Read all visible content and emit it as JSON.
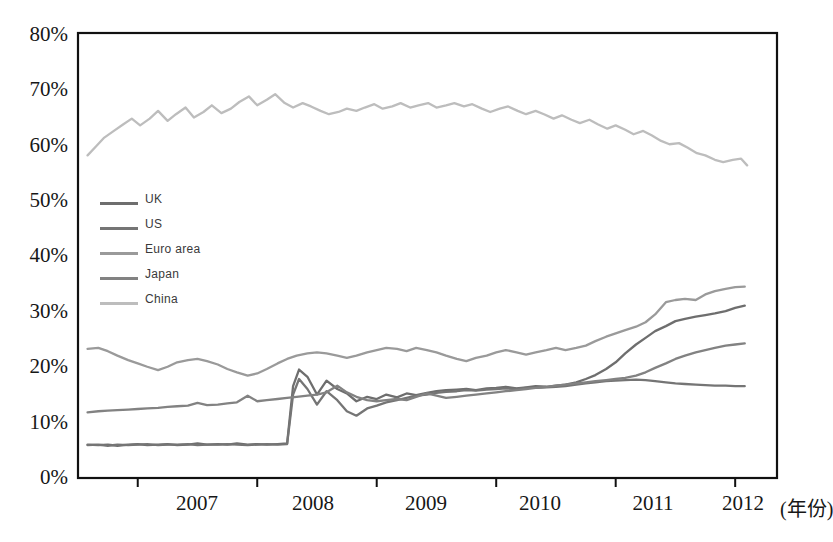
{
  "chart_data": {
    "type": "line",
    "title": "",
    "subtitle": "",
    "xlabel": "(年份)",
    "ylabel": "",
    "xlim": [
      2006.5,
      2012.35
    ],
    "ylim": [
      0,
      80
    ],
    "grid": false,
    "legend_position": "inside-left-upper-middle",
    "ytick_labels": [
      "80%",
      "70%",
      "60%",
      "50%",
      "40%",
      "30%",
      "20%",
      "10%",
      "0%"
    ],
    "ytick_values": [
      80,
      70,
      60,
      50,
      40,
      30,
      20,
      10,
      0
    ],
    "xtick_labels": [
      "2007",
      "2008",
      "2009",
      "2010",
      "2011",
      "2012"
    ],
    "xtick_values": [
      2007,
      2008,
      2009,
      2010,
      2011,
      2012
    ],
    "axis_unit_note": "(年份)",
    "series": [
      {
        "name": "UK",
        "color": "#6e6e6e",
        "x": [
          2006.58,
          2006.67,
          2006.75,
          2006.83,
          2006.92,
          2007.0,
          2007.08,
          2007.17,
          2007.25,
          2007.33,
          2007.42,
          2007.5,
          2007.58,
          2007.67,
          2007.75,
          2007.83,
          2007.92,
          2008.0,
          2008.08,
          2008.17,
          2008.25,
          2008.3,
          2008.35,
          2008.42,
          2008.5,
          2008.58,
          2008.67,
          2008.75,
          2008.83,
          2008.92,
          2009.0,
          2009.08,
          2009.17,
          2009.25,
          2009.33,
          2009.42,
          2009.5,
          2009.58,
          2009.67,
          2009.75,
          2009.83,
          2009.92,
          2010.0,
          2010.08,
          2010.17,
          2010.25,
          2010.33,
          2010.42,
          2010.5,
          2010.58,
          2010.67,
          2010.75,
          2010.83,
          2010.92,
          2011.0,
          2011.08,
          2011.17,
          2011.25,
          2011.33,
          2011.42,
          2011.5,
          2011.58,
          2011.67,
          2011.75,
          2011.83,
          2011.92,
          2012.0,
          2012.08
        ],
        "values": [
          6.0,
          5.9,
          6.0,
          5.8,
          6.0,
          6.1,
          5.9,
          6.0,
          6.1,
          5.9,
          6.0,
          6.2,
          6.0,
          6.1,
          6.0,
          6.2,
          6.0,
          6.1,
          6.0,
          6.1,
          6.2,
          16.5,
          19.5,
          18.2,
          15.0,
          17.5,
          16.0,
          15.2,
          13.8,
          14.6,
          14.2,
          15.0,
          14.5,
          15.2,
          14.9,
          15.3,
          15.6,
          15.8,
          15.9,
          16.0,
          15.8,
          16.1,
          16.2,
          16.4,
          16.1,
          16.3,
          16.5,
          16.4,
          16.6,
          16.8,
          17.2,
          17.8,
          18.5,
          19.6,
          20.8,
          22.4,
          24.0,
          25.2,
          26.4,
          27.3,
          28.2,
          28.6,
          29.0,
          29.3,
          29.6,
          30.0,
          30.6,
          31.0
        ]
      },
      {
        "name": "US",
        "color": "#757575",
        "x": [
          2006.58,
          2006.67,
          2006.75,
          2006.83,
          2006.92,
          2007.0,
          2007.08,
          2007.17,
          2007.25,
          2007.33,
          2007.42,
          2007.5,
          2007.58,
          2007.67,
          2007.75,
          2007.83,
          2007.92,
          2008.0,
          2008.08,
          2008.17,
          2008.25,
          2008.3,
          2008.35,
          2008.42,
          2008.5,
          2008.58,
          2008.67,
          2008.75,
          2008.83,
          2008.92,
          2009.0,
          2009.08,
          2009.17,
          2009.25,
          2009.33,
          2009.42,
          2009.5,
          2009.58,
          2009.67,
          2009.75,
          2009.83,
          2009.92,
          2010.0,
          2010.08,
          2010.17,
          2010.25,
          2010.33,
          2010.42,
          2010.5,
          2010.58,
          2010.67,
          2010.75,
          2010.83,
          2010.92,
          2011.0,
          2011.08,
          2011.17,
          2011.25,
          2011.33,
          2011.42,
          2011.5,
          2011.58,
          2011.67,
          2011.75,
          2011.83,
          2011.92,
          2012.0,
          2012.08
        ],
        "values": [
          5.9,
          6.0,
          5.8,
          6.0,
          5.9,
          6.0,
          6.1,
          5.9,
          6.0,
          6.0,
          6.1,
          5.9,
          6.0,
          6.0,
          6.1,
          6.0,
          5.9,
          6.0,
          6.1,
          6.0,
          6.1,
          15.0,
          17.8,
          16.0,
          13.2,
          15.6,
          14.0,
          12.0,
          11.2,
          12.5,
          13.0,
          13.6,
          14.0,
          14.4,
          14.8,
          15.0,
          15.3,
          15.5,
          15.6,
          15.8,
          15.7,
          15.9,
          16.0,
          16.1,
          16.0,
          16.2,
          16.2,
          16.3,
          16.4,
          16.5,
          16.8,
          17.0,
          17.2,
          17.4,
          17.5,
          17.6,
          17.7,
          17.6,
          17.4,
          17.2,
          17.0,
          16.9,
          16.8,
          16.7,
          16.6,
          16.6,
          16.5,
          16.5
        ]
      },
      {
        "name": "Euro area",
        "color": "#9a9a9a",
        "x": [
          2006.58,
          2006.67,
          2006.75,
          2006.83,
          2006.92,
          2007.0,
          2007.08,
          2007.17,
          2007.25,
          2007.33,
          2007.42,
          2007.5,
          2007.58,
          2007.67,
          2007.75,
          2007.83,
          2007.92,
          2008.0,
          2008.08,
          2008.17,
          2008.25,
          2008.33,
          2008.42,
          2008.5,
          2008.58,
          2008.67,
          2008.75,
          2008.83,
          2008.92,
          2009.0,
          2009.08,
          2009.17,
          2009.25,
          2009.33,
          2009.42,
          2009.5,
          2009.58,
          2009.67,
          2009.75,
          2009.83,
          2009.92,
          2010.0,
          2010.08,
          2010.17,
          2010.25,
          2010.33,
          2010.42,
          2010.5,
          2010.58,
          2010.67,
          2010.75,
          2010.83,
          2010.92,
          2011.0,
          2011.08,
          2011.17,
          2011.25,
          2011.33,
          2011.42,
          2011.5,
          2011.58,
          2011.67,
          2011.75,
          2011.83,
          2011.92,
          2012.0,
          2012.08
        ],
        "values": [
          23.2,
          23.4,
          22.8,
          22.0,
          21.2,
          20.6,
          20.0,
          19.4,
          20.0,
          20.8,
          21.2,
          21.4,
          21.0,
          20.4,
          19.6,
          19.0,
          18.4,
          18.8,
          19.6,
          20.6,
          21.4,
          22.0,
          22.4,
          22.6,
          22.4,
          22.0,
          21.6,
          22.0,
          22.6,
          23.0,
          23.4,
          23.2,
          22.8,
          23.4,
          23.0,
          22.6,
          22.0,
          21.4,
          21.0,
          21.6,
          22.0,
          22.6,
          23.0,
          22.6,
          22.2,
          22.6,
          23.0,
          23.4,
          23.0,
          23.4,
          23.8,
          24.6,
          25.4,
          26.0,
          26.6,
          27.2,
          28.0,
          29.4,
          31.6,
          32.0,
          32.2,
          32.0,
          33.0,
          33.6,
          34.0,
          34.3,
          34.4
        ]
      },
      {
        "name": "Japan",
        "color": "#828282",
        "x": [
          2006.58,
          2006.67,
          2006.75,
          2006.83,
          2006.92,
          2007.0,
          2007.08,
          2007.17,
          2007.25,
          2007.33,
          2007.42,
          2007.5,
          2007.58,
          2007.67,
          2007.75,
          2007.83,
          2007.92,
          2008.0,
          2008.08,
          2008.17,
          2008.25,
          2008.33,
          2008.42,
          2008.5,
          2008.58,
          2008.67,
          2008.75,
          2008.83,
          2008.92,
          2009.0,
          2009.08,
          2009.17,
          2009.25,
          2009.33,
          2009.42,
          2009.5,
          2009.58,
          2009.67,
          2009.75,
          2009.83,
          2009.92,
          2010.0,
          2010.08,
          2010.17,
          2010.25,
          2010.33,
          2010.42,
          2010.5,
          2010.58,
          2010.67,
          2010.75,
          2010.83,
          2010.92,
          2011.0,
          2011.08,
          2011.17,
          2011.25,
          2011.33,
          2011.42,
          2011.5,
          2011.58,
          2011.67,
          2011.75,
          2011.83,
          2011.92,
          2012.0,
          2012.08
        ],
        "values": [
          11.8,
          12.0,
          12.1,
          12.2,
          12.3,
          12.4,
          12.5,
          12.6,
          12.8,
          12.9,
          13.0,
          13.5,
          13.1,
          13.2,
          13.4,
          13.6,
          14.8,
          13.8,
          14.0,
          14.2,
          14.4,
          14.6,
          14.8,
          15.0,
          15.4,
          16.6,
          15.4,
          14.6,
          14.0,
          13.8,
          14.0,
          14.2,
          14.0,
          14.6,
          15.2,
          14.8,
          14.4,
          14.6,
          14.8,
          15.0,
          15.2,
          15.4,
          15.6,
          15.8,
          16.0,
          16.2,
          16.4,
          16.6,
          16.8,
          17.0,
          17.2,
          17.4,
          17.6,
          17.8,
          18.0,
          18.4,
          19.0,
          19.8,
          20.6,
          21.4,
          22.0,
          22.6,
          23.0,
          23.4,
          23.8,
          24.0,
          24.2
        ]
      },
      {
        "name": "China",
        "color": "#bdbdbd",
        "x": [
          2006.58,
          2006.65,
          2006.72,
          2006.8,
          2006.88,
          2006.95,
          2007.02,
          2007.1,
          2007.17,
          2007.25,
          2007.32,
          2007.4,
          2007.47,
          2007.55,
          2007.62,
          2007.7,
          2007.78,
          2007.85,
          2007.93,
          2008.0,
          2008.08,
          2008.15,
          2008.23,
          2008.3,
          2008.38,
          2008.45,
          2008.53,
          2008.6,
          2008.68,
          2008.75,
          2008.83,
          2008.9,
          2008.98,
          2009.05,
          2009.13,
          2009.2,
          2009.28,
          2009.35,
          2009.43,
          2009.5,
          2009.58,
          2009.65,
          2009.73,
          2009.8,
          2009.88,
          2009.95,
          2010.03,
          2010.1,
          2010.18,
          2010.25,
          2010.33,
          2010.4,
          2010.48,
          2010.55,
          2010.63,
          2010.7,
          2010.78,
          2010.85,
          2010.93,
          2011.0,
          2011.08,
          2011.15,
          2011.23,
          2011.3,
          2011.38,
          2011.45,
          2011.53,
          2011.6,
          2011.68,
          2011.75,
          2011.83,
          2011.9,
          2011.98,
          2012.05,
          2012.1
        ],
        "values": [
          58.0,
          59.6,
          61.2,
          62.4,
          63.6,
          64.6,
          63.4,
          64.6,
          66.0,
          64.2,
          65.4,
          66.6,
          64.8,
          65.8,
          67.0,
          65.6,
          66.4,
          67.6,
          68.6,
          67.0,
          68.0,
          69.0,
          67.4,
          66.6,
          67.4,
          66.8,
          66.0,
          65.4,
          65.8,
          66.4,
          66.0,
          66.6,
          67.2,
          66.4,
          66.8,
          67.4,
          66.6,
          67.0,
          67.4,
          66.6,
          67.0,
          67.4,
          66.8,
          67.2,
          66.4,
          65.8,
          66.4,
          66.8,
          66.0,
          65.4,
          66.0,
          65.4,
          64.6,
          65.2,
          64.4,
          63.8,
          64.4,
          63.6,
          62.8,
          63.4,
          62.6,
          61.8,
          62.4,
          61.6,
          60.6,
          60.0,
          60.2,
          59.4,
          58.4,
          58.0,
          57.2,
          56.8,
          57.2,
          57.4,
          56.2
        ]
      }
    ]
  },
  "legend": {
    "items": [
      {
        "label": "UK",
        "color": "#6e6e6e"
      },
      {
        "label": "US",
        "color": "#757575"
      },
      {
        "label": "Euro area",
        "color": "#9a9a9a"
      },
      {
        "label": "Japan",
        "color": "#828282"
      },
      {
        "label": "China",
        "color": "#bdbdbd"
      }
    ]
  },
  "axes": {
    "y_labels": [
      "80%",
      "70%",
      "60%",
      "50%",
      "40%",
      "30%",
      "20%",
      "10%",
      "0%"
    ],
    "x_labels": [
      "2007",
      "2008",
      "2009",
      "2010",
      "2011",
      "2012"
    ],
    "x_unit": "(年份)"
  }
}
